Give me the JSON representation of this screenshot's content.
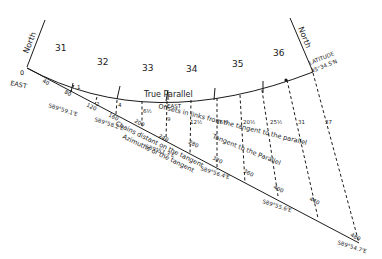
{
  "diagram": {
    "title_labels": {
      "north_left": "North",
      "north_right": "North",
      "east": "EAST",
      "latitude_label": "LATITUDE",
      "latitude_value": "45°34.5'N",
      "true_parallel": "True Parallel",
      "parallel_east": "EAST",
      "offsets_caption": "Offsets in links from the tangent to the parallel",
      "tangent_caption": "Tangent to the Parallel",
      "chains_caption": "Chains distant on the tangent",
      "azimuths_caption": "Azimuths of the tangent",
      "origin": "0"
    },
    "sections": [
      "31",
      "32",
      "33",
      "34",
      "35",
      "36"
    ],
    "chain_marks": [
      "40",
      "80",
      "120",
      "160",
      "200",
      "240",
      "280",
      "320",
      "360",
      "400",
      "440",
      "480"
    ],
    "offsets": [
      "1",
      "2",
      "4",
      "6½",
      "9",
      "12½",
      "16½",
      "20½",
      "25½",
      "31",
      "37"
    ],
    "azimuths": [
      "S89°59.1'E",
      "S89°58.2'E",
      "S89°57.3'E",
      "S89°56.4'E",
      "S89°55.6'E",
      "S89°54.7'E"
    ]
  }
}
